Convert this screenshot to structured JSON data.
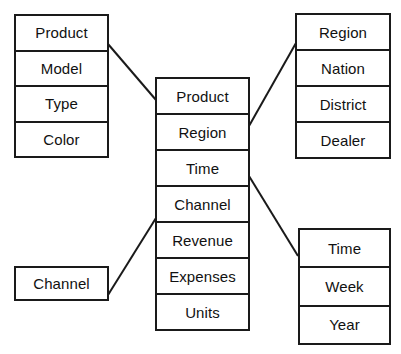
{
  "diagram": {
    "line_color": "#1a1a1a",
    "border_color": "#1a1a1a",
    "background_color": "#ffffff",
    "text_color": "#111111"
  },
  "tables": {
    "product_dimension": {
      "name": "Product dimension",
      "rows": [
        {
          "label": "Product"
        },
        {
          "label": "Model"
        },
        {
          "label": "Type"
        },
        {
          "label": "Color"
        }
      ]
    },
    "fact": {
      "name": "Fact table",
      "rows": [
        {
          "label": "Product"
        },
        {
          "label": "Region"
        },
        {
          "label": "Time"
        },
        {
          "label": "Channel"
        },
        {
          "label": "Revenue"
        },
        {
          "label": "Expenses"
        },
        {
          "label": "Units"
        }
      ]
    },
    "region_dimension": {
      "name": "Region dimension",
      "rows": [
        {
          "label": "Region"
        },
        {
          "label": "Nation"
        },
        {
          "label": "District"
        },
        {
          "label": "Dealer"
        }
      ]
    },
    "time_dimension": {
      "name": "Time dimension",
      "rows": [
        {
          "label": "Time"
        },
        {
          "label": "Week"
        },
        {
          "label": "Year"
        }
      ]
    },
    "channel_dimension": {
      "name": "Channel dimension",
      "rows": [
        {
          "label": "Channel"
        }
      ]
    }
  },
  "connectors": [
    {
      "name": "product-to-fact",
      "from": "product_dimension",
      "to": "fact",
      "x1": 108,
      "y1": 44,
      "x2": 156,
      "y2": 100
    },
    {
      "name": "region-to-fact",
      "from": "fact",
      "to": "region_dimension",
      "x1": 249,
      "y1": 126,
      "x2": 296,
      "y2": 43
    },
    {
      "name": "time-to-fact",
      "from": "fact",
      "to": "time_dimension",
      "x1": 249,
      "y1": 176,
      "x2": 298,
      "y2": 256
    },
    {
      "name": "channel-to-fact",
      "from": "channel_dimension",
      "to": "fact",
      "x1": 108,
      "y1": 295,
      "x2": 156,
      "y2": 218
    }
  ]
}
